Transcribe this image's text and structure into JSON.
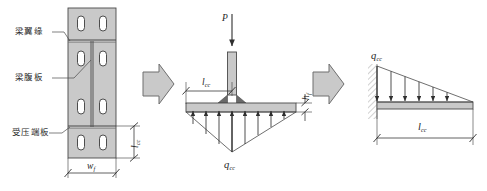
{
  "figure": {
    "title": "",
    "background_color": "#ffffff",
    "plate_fill": "#c9c9c9",
    "plate_stroke": "#4a4a4a",
    "hole_fill": "#ffffff",
    "arrow_fill": "#c9c9c9",
    "arrow_stroke": "#6e6e6e",
    "line_color": "#3a3a3a",
    "text_color": "#2b2b2b"
  },
  "panel_left": {
    "name": "end-plate-elevation",
    "labels": {
      "flange": "梁翼缘",
      "web": "梁腹板",
      "end_plate": "受压端板"
    },
    "dimensions": {
      "width": {
        "symbol": "w",
        "subscript": "f"
      },
      "height": {
        "symbol": "l",
        "subscript": "cc"
      }
    },
    "hole_count": 8,
    "hole_rows": 4,
    "hole_cols": 2
  },
  "panel_middle": {
    "name": "tee-stub-free-body",
    "point_load": {
      "symbol": "P",
      "subscript": ""
    },
    "distributed_load": {
      "symbol": "q",
      "subscript": "cc"
    },
    "span": {
      "symbol": "l",
      "subscript": "cc"
    },
    "thickness": {
      "symbol": "h",
      "subscript": "f"
    },
    "pressure_arrow_count": 8
  },
  "panel_right": {
    "name": "cantilever-triangular-load",
    "distributed_load": {
      "symbol": "q",
      "subscript": "cc"
    },
    "span": {
      "symbol": "l",
      "subscript": "cc"
    },
    "load_arrow_count": 6,
    "support": "fixed-end-hatch"
  },
  "arrows": {
    "first": "block-arrow-right",
    "second": "block-arrow-right"
  }
}
